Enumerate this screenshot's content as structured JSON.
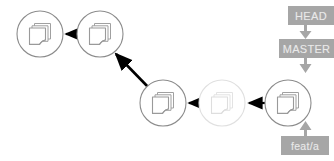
{
  "diagram": {
    "type": "git-commit-graph",
    "background_color": "#ffffff",
    "colors": {
      "node_stroke": "#808080",
      "node_stroke_faded": "#e0e0e0",
      "icon_stroke": "#9a9a9a",
      "icon_stroke_faded": "#e8e8e8",
      "arrow": "#000000",
      "pointer_arrow": "#a6a6a6",
      "label_bg": "#a6a6a6",
      "label_text": "#e9e9e9"
    },
    "nodes": [
      {
        "id": "commit-1",
        "name": "commit-node-1",
        "cx": 40,
        "cy": 34,
        "r": 23,
        "state": "normal",
        "icon": "document-stack-icon"
      },
      {
        "id": "commit-2",
        "name": "commit-node-2",
        "cx": 100,
        "cy": 34,
        "r": 23,
        "state": "normal",
        "icon": "document-stack-icon"
      },
      {
        "id": "commit-3",
        "name": "commit-node-3",
        "cx": 163,
        "cy": 103,
        "r": 23,
        "state": "normal",
        "icon": "document-stack-icon"
      },
      {
        "id": "commit-4",
        "name": "commit-node-ghost",
        "cx": 222,
        "cy": 103,
        "r": 23,
        "state": "faded",
        "icon": "document-stack-icon"
      },
      {
        "id": "commit-5",
        "name": "commit-node-head",
        "cx": 288,
        "cy": 103,
        "r": 23,
        "state": "normal",
        "icon": "document-stack-icon"
      }
    ],
    "edges": [
      {
        "name": "edge-commit2-to-commit1",
        "from": "commit-2",
        "to": "commit-1",
        "x1": 78,
        "y1": 34,
        "x2": 64,
        "y2": 34
      },
      {
        "name": "edge-commit3-to-commit2",
        "from": "commit-3",
        "to": "commit-2",
        "x1": 148,
        "y1": 87,
        "x2": 114,
        "y2": 52
      },
      {
        "name": "edge-commit4-to-commit3",
        "from": "commit-4",
        "to": "commit-3",
        "x1": 200,
        "y1": 103,
        "x2": 187,
        "y2": 103
      },
      {
        "name": "edge-commit5-to-commit4",
        "from": "commit-5",
        "to": "commit-4",
        "x1": 265,
        "y1": 103,
        "x2": 247,
        "y2": 103
      }
    ],
    "labels": [
      {
        "id": "head",
        "name": "head-pointer-label",
        "text": "HEAD",
        "points_to": "MASTER"
      },
      {
        "id": "master",
        "name": "master-branch-label",
        "text": "MASTER",
        "points_to": "commit-node-head"
      },
      {
        "id": "feata",
        "name": "feata-branch-label",
        "text": "feat/a",
        "points_to": "commit-node-head"
      }
    ]
  }
}
